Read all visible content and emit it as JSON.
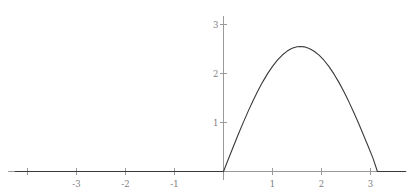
{
  "chart_data": {
    "type": "line",
    "title": "",
    "subtitle": "",
    "xlabel": "",
    "ylabel": "",
    "xlim": [
      -4.25,
      3.75
    ],
    "ylim": [
      -0.45,
      3.45
    ],
    "grid": false,
    "legend": null,
    "annotations": [],
    "axis_color": "#9a9a9a",
    "curve_color": "#3a3a3a",
    "tick_label_color": "#808080",
    "line_width": 1.1,
    "x_ticks": [
      -4,
      -3,
      -2,
      -1,
      1,
      2,
      3
    ],
    "x_tick_labels": [
      "",
      "-3",
      "-2",
      "-1",
      "1",
      "2",
      "3"
    ],
    "y_ticks": [
      1,
      2,
      3
    ],
    "y_tick_labels": [
      "1",
      "2",
      "3"
    ],
    "series": [
      {
        "name": "f(x)",
        "description": "zero for x <= 0, half sine hump of amplitude 2.55 on [0, pi], zero after",
        "amplitude": 2.55,
        "period_start": 0,
        "period_end": 3.14159,
        "x": [
          -4.25,
          -4,
          -3.5,
          -3,
          -2.5,
          -2,
          -1.5,
          -1,
          -0.5,
          -0.25,
          0,
          0.1,
          0.2,
          0.3,
          0.4,
          0.5,
          0.6,
          0.7,
          0.8,
          0.9,
          1.0,
          1.1,
          1.2,
          1.3,
          1.4,
          1.5,
          1.5708,
          1.65,
          1.75,
          1.85,
          1.95,
          2.05,
          2.15,
          2.25,
          2.35,
          2.45,
          2.55,
          2.65,
          2.75,
          2.85,
          2.95,
          3.05,
          3.14159
        ],
        "y": [
          0,
          0,
          0,
          0,
          0,
          0,
          0,
          0,
          0,
          0,
          0,
          0.2546,
          0.5065,
          0.7535,
          0.993,
          1.2224,
          1.4399,
          1.6434,
          1.8293,
          1.9971,
          2.1455,
          2.2725,
          2.377,
          2.458,
          2.5148,
          2.547,
          2.55,
          2.5443,
          2.5118,
          2.4551,
          2.3745,
          2.2706,
          2.1443,
          1.9967,
          1.8292,
          1.6435,
          1.4416,
          1.2256,
          0.9981,
          0.7615,
          0.5187,
          0.2723,
          0.0
        ]
      }
    ]
  }
}
